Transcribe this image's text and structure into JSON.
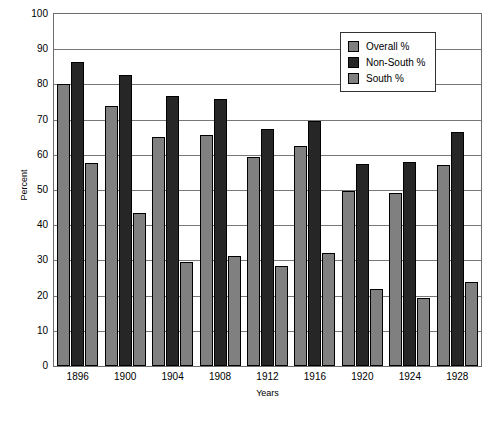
{
  "chart_data": {
    "type": "bar",
    "title": "",
    "xlabel": "Years",
    "ylabel": "Percent",
    "ylim": [
      0,
      100
    ],
    "ytick_step": 10,
    "grid": true,
    "legend_position": "top-right",
    "categories": [
      "1896",
      "1900",
      "1904",
      "1908",
      "1912",
      "1916",
      "1920",
      "1924",
      "1928"
    ],
    "yticks": [
      "100",
      "90",
      "80",
      "70",
      "60",
      "50",
      "40",
      "30",
      "20",
      "10",
      "0"
    ],
    "series": [
      {
        "name": "Overall %",
        "color": "#808080",
        "values": [
          80.0,
          73.8,
          65.2,
          65.6,
          59.4,
          62.4,
          49.7,
          49.2,
          57.0
        ]
      },
      {
        "name": "Non-South %",
        "color": "#262626",
        "values": [
          86.5,
          82.6,
          76.6,
          75.9,
          67.2,
          69.6,
          57.4,
          58.0,
          66.5
        ]
      },
      {
        "name": "South %",
        "color": "#808080",
        "values": [
          57.7,
          43.4,
          29.5,
          31.2,
          28.4,
          32.0,
          22.0,
          19.4,
          24.0
        ]
      }
    ]
  }
}
